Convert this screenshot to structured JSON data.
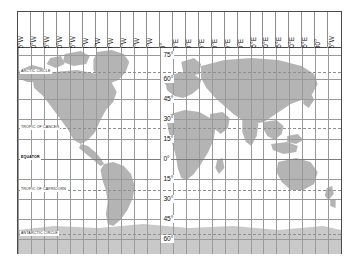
{
  "figure": {
    "projection": "mercator-style cylindrical",
    "frame_color": "#4a4a4a",
    "land_color": "#b4b4b4",
    "ocean_color": "#ffffff",
    "grid_color": "#9a9a9a"
  },
  "longitude_axis": {
    "position": "top",
    "orientation": "vertical-rotated",
    "labels": [
      "165°W",
      "150°W",
      "135°W",
      "120°W",
      "105°W",
      "90°W",
      "75°W",
      "60°W",
      "45°W",
      "30°W",
      "15°W",
      "0°",
      "15°E",
      "30°E",
      "45°E",
      "60°E",
      "75°E",
      "90°E",
      "105°E",
      "120°E",
      "135°E",
      "150°E",
      "165°E",
      "180°",
      "165°W"
    ]
  },
  "latitude_axis": {
    "position": "prime-meridian",
    "labels": [
      "75°",
      "60°",
      "45°",
      "30°",
      "15°",
      "0°",
      "15°",
      "30°",
      "45°",
      "60°"
    ]
  },
  "named_lines": {
    "arctic_circle": "ARCTIC CIRCLE",
    "tropic_of_cancer": "TROPIC OF CANCER",
    "equator": "EQUATOR",
    "tropic_of_capricorn": "TROPIC OF CAPRICORN",
    "antarctic_circle": "ANTARCTIC CIRCLE"
  },
  "chart_data": {
    "type": "map",
    "xlabel": "Longitude",
    "ylabel": "Latitude",
    "xlim": [
      -180,
      180
    ],
    "ylim": [
      -75,
      83
    ],
    "grid": true,
    "x_tick_interval_deg": 15,
    "y_tick_interval_deg": 15,
    "x_ticks": [
      -165,
      -150,
      -135,
      -120,
      -105,
      -90,
      -75,
      -60,
      -45,
      -30,
      -15,
      0,
      15,
      30,
      45,
      60,
      75,
      90,
      105,
      120,
      135,
      150,
      165,
      180,
      195
    ],
    "x_tick_labels": [
      "165°W",
      "150°W",
      "135°W",
      "120°W",
      "105°W",
      "90°W",
      "75°W",
      "60°W",
      "45°W",
      "30°W",
      "15°W",
      "0°",
      "15°E",
      "30°E",
      "45°E",
      "60°E",
      "75°E",
      "90°E",
      "105°E",
      "120°E",
      "135°E",
      "150°E",
      "165°E",
      "180°",
      "165°W"
    ],
    "y_ticks": [
      75,
      60,
      45,
      30,
      15,
      0,
      -15,
      -30,
      -45,
      -60
    ],
    "y_tick_labels": [
      "75°",
      "60°",
      "45°",
      "30°",
      "15°",
      "0°",
      "15°",
      "30°",
      "45°",
      "60°"
    ],
    "reference_lines": [
      {
        "name": "ARCTIC CIRCLE",
        "latitude": 66.5,
        "style": "dashed"
      },
      {
        "name": "TROPIC OF CANCER",
        "latitude": 23.5,
        "style": "dashed"
      },
      {
        "name": "EQUATOR",
        "latitude": 0,
        "style": "solid"
      },
      {
        "name": "TROPIC OF CAPRICORN",
        "latitude": -23.5,
        "style": "dashed"
      },
      {
        "name": "ANTARCTIC CIRCLE",
        "latitude": -66.5,
        "style": "dashed"
      }
    ],
    "landmasses": [
      "North America",
      "South America",
      "Europe",
      "Africa",
      "Asia",
      "Australia",
      "Antarctica",
      "Greenland",
      "New Zealand"
    ]
  }
}
